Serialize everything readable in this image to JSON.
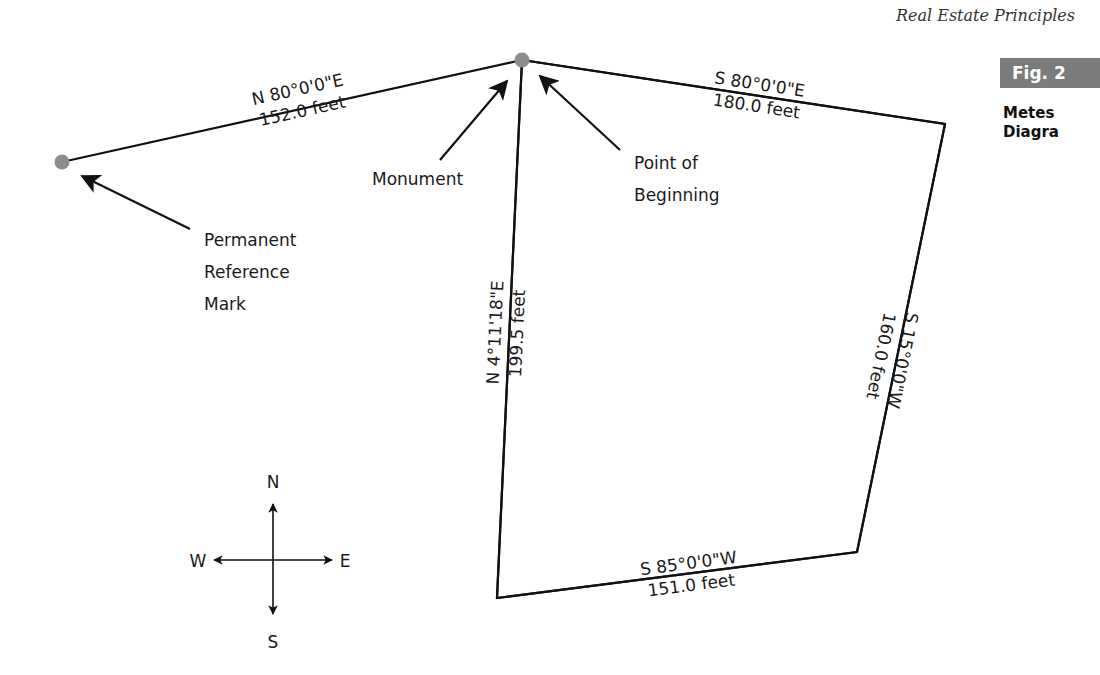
{
  "header": {
    "book_title": "Real Estate Principles"
  },
  "figure": {
    "badge": "Fig. 2",
    "title_lines": [
      "Metes",
      "Diagra"
    ]
  },
  "colors": {
    "line": "#111111",
    "marker": "#8c8c8c",
    "badge_bg": "#7b7b7b"
  },
  "annotations": {
    "monument": "Monument",
    "point_of_beginning": [
      "Point of",
      "Beginning"
    ],
    "reference_mark": [
      "Permanent",
      "Reference",
      "Mark"
    ]
  },
  "courses": [
    {
      "id": "reference-tie",
      "bearing": "N 80°0'0\"E",
      "distance": "152.0 feet"
    },
    {
      "id": "north-line",
      "bearing": "S 80°0'0\"E",
      "distance": "180.0 feet"
    },
    {
      "id": "east-line",
      "bearing": "S 15°0'0\"W",
      "distance": "160.0 feet"
    },
    {
      "id": "south-line",
      "bearing": "S 85°0'0\"W",
      "distance": "151.0 feet"
    },
    {
      "id": "west-line",
      "bearing": "N 4°11'18\"E",
      "distance": "199.5 feet"
    }
  ],
  "compass": {
    "north": "N",
    "south": "S",
    "east": "E",
    "west": "W"
  }
}
